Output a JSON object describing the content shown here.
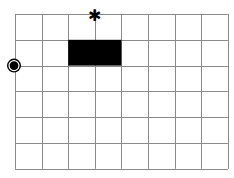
{
  "board": {
    "columns": 8,
    "rows": 6,
    "origin": {
      "x": 15,
      "y": 14
    },
    "cell_width": 26.6,
    "cell_height": 25.8,
    "line_color": "#8a8a8a",
    "background": "#ffffff"
  },
  "pieces": {
    "wall": {
      "col_start": 2,
      "col_end": 4,
      "row_start": 1,
      "row_end": 2,
      "color": "#000000"
    },
    "goal_star": {
      "glyph": "✱",
      "col": 3,
      "row": 0,
      "color": "#000000"
    },
    "player": {
      "col": 0,
      "row": 2,
      "color": "#000000"
    }
  }
}
